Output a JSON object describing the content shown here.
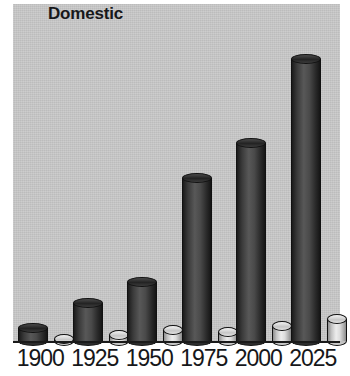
{
  "chart": {
    "title": "Domestic"
  },
  "chart_data": {
    "type": "bar",
    "title": "Domestic",
    "xlabel": "",
    "ylabel": "",
    "grid": false,
    "legend_position": "none",
    "style": "3d-cylinder-grouped",
    "plot_background": "#c9c9c9",
    "categories": [
      "1900",
      "1925",
      "1950",
      "1975",
      "2000",
      "2025"
    ],
    "ylim": [
      0,
      145
    ],
    "series": [
      {
        "name": "Domestic",
        "color": "#333333",
        "values": [
          8,
          19,
          28,
          74,
          89,
          126
        ]
      },
      {
        "name": "Secondary",
        "color": "#e0e0e0",
        "values": [
          3,
          5,
          7,
          6,
          9,
          12
        ]
      }
    ],
    "annotations": []
  },
  "axis": {
    "tick_labels": [
      "1900",
      "1925",
      "1950",
      "1975",
      "2000",
      "2025"
    ]
  }
}
